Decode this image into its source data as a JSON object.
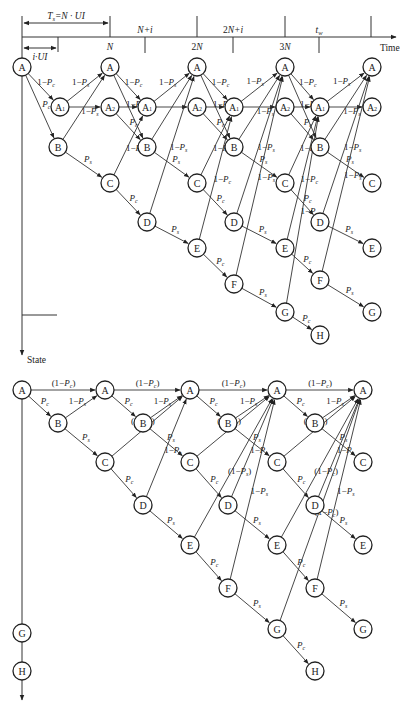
{
  "top_diagram": {
    "time_axis": {
      "label": "Time",
      "ticks_above": [
        "N+i",
        "2N+i",
        "t_w"
      ],
      "ticks_below": [
        "N",
        "2N",
        "3N"
      ],
      "interval_labels": [
        "T_s=N·UI",
        "i·UI"
      ]
    },
    "state_axis_label": "State",
    "nodes": [
      {
        "id": "t_a0",
        "label": "A",
        "x": 22,
        "y": 67
      },
      {
        "id": "t_a1_0",
        "label": "A₁",
        "x": 60,
        "y": 107
      },
      {
        "id": "t_b0",
        "label": "B",
        "x": 58,
        "y": 147
      },
      {
        "id": "t_a_1",
        "label": "A",
        "x": 110,
        "y": 67
      },
      {
        "id": "t_a2_1",
        "label": "A₂",
        "x": 110,
        "y": 107
      },
      {
        "id": "t_c0",
        "label": "C",
        "x": 110,
        "y": 183
      },
      {
        "id": "t_a1_1",
        "label": "A₁",
        "x": 147,
        "y": 107
      },
      {
        "id": "t_b1",
        "label": "B",
        "x": 147,
        "y": 147
      },
      {
        "id": "t_d0",
        "label": "D",
        "x": 147,
        "y": 222
      },
      {
        "id": "t_a_2",
        "label": "A",
        "x": 197,
        "y": 67
      },
      {
        "id": "t_a2_2",
        "label": "A₂",
        "x": 197,
        "y": 107
      },
      {
        "id": "t_c1",
        "label": "C",
        "x": 197,
        "y": 183
      },
      {
        "id": "t_e0",
        "label": "E",
        "x": 197,
        "y": 248
      },
      {
        "id": "t_a1_2",
        "label": "A₁",
        "x": 234,
        "y": 107
      },
      {
        "id": "t_b2",
        "label": "B",
        "x": 234,
        "y": 147
      },
      {
        "id": "t_d1",
        "label": "D",
        "x": 234,
        "y": 222
      },
      {
        "id": "t_f0",
        "label": "F",
        "x": 234,
        "y": 284
      },
      {
        "id": "t_a_3",
        "label": "A",
        "x": 285,
        "y": 67
      },
      {
        "id": "t_a2_3",
        "label": "A₂",
        "x": 285,
        "y": 107
      },
      {
        "id": "t_c2",
        "label": "C",
        "x": 285,
        "y": 183
      },
      {
        "id": "t_e1",
        "label": "E",
        "x": 285,
        "y": 248
      },
      {
        "id": "t_g0",
        "label": "G",
        "x": 285,
        "y": 312
      },
      {
        "id": "t_a1_3",
        "label": "A₁",
        "x": 320,
        "y": 107
      },
      {
        "id": "t_b3",
        "label": "B",
        "x": 320,
        "y": 147
      },
      {
        "id": "t_d2",
        "label": "D",
        "x": 320,
        "y": 222
      },
      {
        "id": "t_f1",
        "label": "F",
        "x": 320,
        "y": 280
      },
      {
        "id": "t_h0",
        "label": "H",
        "x": 320,
        "y": 335
      },
      {
        "id": "t_a_4",
        "label": "A",
        "x": 372,
        "y": 67
      },
      {
        "id": "t_a2_4",
        "label": "A₂",
        "x": 372,
        "y": 107
      },
      {
        "id": "t_c3",
        "label": "C",
        "x": 372,
        "y": 183
      },
      {
        "id": "t_e2",
        "label": "E",
        "x": 372,
        "y": 248
      },
      {
        "id": "t_g1",
        "label": "G",
        "x": 372,
        "y": 312
      }
    ],
    "edges": [
      {
        "from": "t_a0",
        "to": "t_a1_0",
        "label": "1−P_c"
      },
      {
        "from": "t_a0",
        "to": "t_b0",
        "label": "P_c"
      },
      {
        "from": "t_a1_0",
        "to": "t_a_1",
        "label": "1−P_s"
      },
      {
        "from": "t_a1_0",
        "to": "t_a2_1",
        "label": ""
      },
      {
        "from": "t_b0",
        "to": "t_a_1",
        "label": "1−P_s"
      },
      {
        "from": "t_b0",
        "to": "t_c0",
        "label": "P_s"
      },
      {
        "from": "t_a_1",
        "to": "t_a1_1",
        "label": "1−P_c"
      },
      {
        "from": "t_a_1",
        "to": "t_b1",
        "label": "1−P_c"
      },
      {
        "from": "t_a2_1",
        "to": "t_a1_1",
        "label": ""
      },
      {
        "from": "t_a2_1",
        "to": "t_b1",
        "label": "P_c"
      },
      {
        "from": "t_c0",
        "to": "t_a1_1",
        "label": "1−P_c"
      },
      {
        "from": "t_c0",
        "to": "t_d0",
        "label": "P_c"
      },
      {
        "from": "t_a1_1",
        "to": "t_a_2",
        "label": "1−P_s"
      },
      {
        "from": "t_a1_1",
        "to": "t_a2_2",
        "label": ""
      },
      {
        "from": "t_b1",
        "to": "t_a_2",
        "label": ""
      },
      {
        "from": "t_b1",
        "to": "t_c1",
        "label": "P_s"
      },
      {
        "from": "t_d0",
        "to": "t_a_2",
        "label": "1−P_s"
      },
      {
        "from": "t_d0",
        "to": "t_e0",
        "label": "P_s"
      },
      {
        "from": "t_a_2",
        "to": "t_a1_2",
        "label": "1−P_c"
      },
      {
        "from": "t_a_2",
        "to": "t_b2",
        "label": "1−P_c"
      },
      {
        "from": "t_a2_2",
        "to": "t_a1_2",
        "label": ""
      },
      {
        "from": "t_a2_2",
        "to": "t_b2",
        "label": "P_c"
      },
      {
        "from": "t_c1",
        "to": "t_a1_2",
        "label": "1−P_c"
      },
      {
        "from": "t_c1",
        "to": "t_d1",
        "label": "P_c"
      },
      {
        "from": "t_e0",
        "to": "t_a1_2",
        "label": "1−P_c"
      },
      {
        "from": "t_e0",
        "to": "t_f0",
        "label": "P_c"
      },
      {
        "from": "t_a1_2",
        "to": "t_a_3",
        "label": "1−P_s"
      },
      {
        "from": "t_a1_2",
        "to": "t_a2_3",
        "label": ""
      },
      {
        "from": "t_b2",
        "to": "t_a_3",
        "label": "1−P_s"
      },
      {
        "from": "t_b2",
        "to": "t_c2",
        "label": "P_s"
      },
      {
        "from": "t_d1",
        "to": "t_a_3",
        "label": "1−P_s"
      },
      {
        "from": "t_d1",
        "to": "t_e1",
        "label": "P_s"
      },
      {
        "from": "t_f0",
        "to": "t_a_3",
        "label": "1−P_s"
      },
      {
        "from": "t_f0",
        "to": "t_g0",
        "label": "P_s"
      },
      {
        "from": "t_a_3",
        "to": "t_a1_3",
        "label": "1−P_c"
      },
      {
        "from": "t_a_3",
        "to": "t_b3",
        "label": "1−P_c"
      },
      {
        "from": "t_a2_3",
        "to": "t_a1_3",
        "label": ""
      },
      {
        "from": "t_a2_3",
        "to": "t_b3",
        "label": "P_c"
      },
      {
        "from": "t_c2",
        "to": "t_a1_3",
        "label": "1−P_c"
      },
      {
        "from": "t_c2",
        "to": "t_d2",
        "label": "P_c"
      },
      {
        "from": "t_e1",
        "to": "t_a1_3",
        "label": "1−P_c"
      },
      {
        "from": "t_e1",
        "to": "t_f1",
        "label": "P_c"
      },
      {
        "from": "t_g0",
        "to": "t_a1_3",
        "label": "1−P_c"
      },
      {
        "from": "t_g0",
        "to": "t_h0",
        "label": "P_c"
      },
      {
        "from": "t_a1_3",
        "to": "t_a_4",
        "label": "1−P_s"
      },
      {
        "from": "t_a1_3",
        "to": "t_a2_4",
        "label": ""
      },
      {
        "from": "t_b3",
        "to": "t_a_4",
        "label": "1−P_s"
      },
      {
        "from": "t_b3",
        "to": "t_c3",
        "label": "P_s"
      },
      {
        "from": "t_d2",
        "to": "t_a_4",
        "label": "1−P_s"
      },
      {
        "from": "t_d2",
        "to": "t_e2",
        "label": "P_s"
      },
      {
        "from": "t_f1",
        "to": "t_a_4",
        "label": "1−P_s"
      },
      {
        "from": "t_f1",
        "to": "t_g1",
        "label": "P_s"
      }
    ]
  },
  "bottom_diagram": {
    "nodes": [
      {
        "id": "b_a0",
        "label": "A",
        "x": 22,
        "y": 390
      },
      {
        "id": "b_b0",
        "label": "B",
        "x": 58,
        "y": 423
      },
      {
        "id": "b_a1",
        "label": "A",
        "x": 105,
        "y": 390
      },
      {
        "id": "b_c0",
        "label": "C",
        "x": 105,
        "y": 462
      },
      {
        "id": "b_b1",
        "label": "B",
        "x": 143,
        "y": 423
      },
      {
        "id": "b_d0",
        "label": "D",
        "x": 143,
        "y": 505
      },
      {
        "id": "b_a2",
        "label": "A",
        "x": 190,
        "y": 390
      },
      {
        "id": "b_c1",
        "label": "C",
        "x": 190,
        "y": 462
      },
      {
        "id": "b_e0",
        "label": "E",
        "x": 190,
        "y": 545
      },
      {
        "id": "b_b2",
        "label": "B",
        "x": 228,
        "y": 423
      },
      {
        "id": "b_d1",
        "label": "D",
        "x": 228,
        "y": 505
      },
      {
        "id": "b_f0",
        "label": "F",
        "x": 228,
        "y": 588
      },
      {
        "id": "b_a3",
        "label": "A",
        "x": 277,
        "y": 390
      },
      {
        "id": "b_c2",
        "label": "C",
        "x": 277,
        "y": 462
      },
      {
        "id": "b_e1",
        "label": "E",
        "x": 277,
        "y": 545
      },
      {
        "id": "b_g0",
        "label": "G",
        "x": 277,
        "y": 629
      },
      {
        "id": "b_b3",
        "label": "B",
        "x": 315,
        "y": 423
      },
      {
        "id": "b_d2",
        "label": "D",
        "x": 315,
        "y": 505
      },
      {
        "id": "b_f1",
        "label": "F",
        "x": 315,
        "y": 588
      },
      {
        "id": "b_h0",
        "label": "H",
        "x": 315,
        "y": 671
      },
      {
        "id": "b_a4",
        "label": "A",
        "x": 363,
        "y": 390
      },
      {
        "id": "b_c3",
        "label": "C",
        "x": 363,
        "y": 462
      },
      {
        "id": "b_e2",
        "label": "E",
        "x": 363,
        "y": 545
      },
      {
        "id": "b_g1",
        "label": "G",
        "x": 363,
        "y": 629
      },
      {
        "id": "b_gs",
        "label": "G",
        "x": 22,
        "y": 633
      },
      {
        "id": "b_hs",
        "label": "H",
        "x": 22,
        "y": 671
      }
    ],
    "edges": [
      {
        "from": "b_a0",
        "to": "b_a1",
        "label": "(1−P_c)"
      },
      {
        "from": "b_a0",
        "to": "b_b0",
        "label": "P_c"
      },
      {
        "from": "b_b0",
        "to": "b_a1",
        "label": "1−P_s"
      },
      {
        "from": "b_b0",
        "to": "b_c0",
        "label": "P_s"
      },
      {
        "from": "b_a1",
        "to": "b_a2",
        "label": "(1−P_c)"
      },
      {
        "from": "b_a1",
        "to": "b_b1",
        "label": "P_c"
      },
      {
        "from": "b_c0",
        "to": "b_a2",
        "label": "(1−P_c)"
      },
      {
        "from": "b_c0",
        "to": "b_d0",
        "label": "P_c"
      },
      {
        "from": "b_b1",
        "to": "b_a2",
        "label": "1−P_s"
      },
      {
        "from": "b_b1",
        "to": "b_c1",
        "label": "P_s"
      },
      {
        "from": "b_d0",
        "to": "b_a2",
        "label": "1−P_s"
      },
      {
        "from": "b_d0",
        "to": "b_e0",
        "label": "P_s"
      },
      {
        "from": "b_a2",
        "to": "b_a3",
        "label": "(1−P_c)"
      },
      {
        "from": "b_a2",
        "to": "b_b2",
        "label": "P_c"
      },
      {
        "from": "b_c1",
        "to": "b_a3",
        "label": "(1−P_c)"
      },
      {
        "from": "b_c1",
        "to": "b_d1",
        "label": "P_c"
      },
      {
        "from": "b_e0",
        "to": "b_a3",
        "label": "(1−P_s)"
      },
      {
        "from": "b_e0",
        "to": "b_f0",
        "label": "P_c"
      },
      {
        "from": "b_b2",
        "to": "b_a3",
        "label": "1−P_s"
      },
      {
        "from": "b_b2",
        "to": "b_c2",
        "label": "P_s"
      },
      {
        "from": "b_d1",
        "to": "b_a3",
        "label": "1−P_s"
      },
      {
        "from": "b_d1",
        "to": "b_e1",
        "label": "P_s"
      },
      {
        "from": "b_f0",
        "to": "b_a3",
        "label": "1−P_s"
      },
      {
        "from": "b_f0",
        "to": "b_g0",
        "label": "P_s"
      },
      {
        "from": "b_a3",
        "to": "b_a4",
        "label": "(1−P_c)"
      },
      {
        "from": "b_a3",
        "to": "b_b3",
        "label": "P_c"
      },
      {
        "from": "b_c2",
        "to": "b_a4",
        "label": "(1−P_c)"
      },
      {
        "from": "b_c2",
        "to": "b_d2",
        "label": "P_c"
      },
      {
        "from": "b_e1",
        "to": "b_a4",
        "label": "(1−P_c)"
      },
      {
        "from": "b_e1",
        "to": "b_f1",
        "label": "P_c"
      },
      {
        "from": "b_g0",
        "to": "b_a4",
        "label": "(1−P_c)"
      },
      {
        "from": "b_g0",
        "to": "b_h0",
        "label": "P_c"
      },
      {
        "from": "b_b3",
        "to": "b_a4",
        "label": "1−P_s"
      },
      {
        "from": "b_b3",
        "to": "b_c3",
        "label": "P_s"
      },
      {
        "from": "b_d2",
        "to": "b_a4",
        "label": "1−P_s"
      },
      {
        "from": "b_d2",
        "to": "b_e2",
        "label": "P_s"
      },
      {
        "from": "b_f1",
        "to": "b_a4",
        "label": "1−P_s"
      },
      {
        "from": "b_f1",
        "to": "b_g1",
        "label": "P_s"
      }
    ]
  }
}
